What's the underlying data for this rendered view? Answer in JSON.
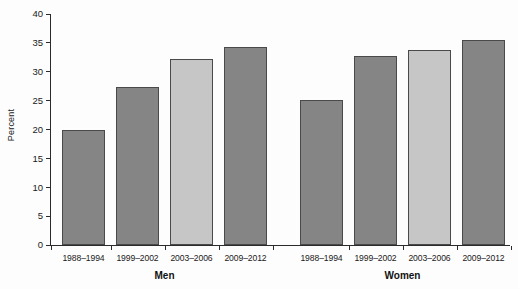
{
  "chart_data": {
    "type": "bar",
    "title": "",
    "xlabel": "",
    "ylabel": "Percent",
    "ylim": [
      0,
      40
    ],
    "yticks": [
      0,
      5,
      10,
      15,
      20,
      25,
      30,
      35,
      40
    ],
    "grid": false,
    "legend": null,
    "categories": [
      "1988–1994",
      "1999–2002",
      "2003–2006",
      "2009–2012"
    ],
    "groups": [
      {
        "name": "Men",
        "bars": [
          {
            "category": "1988–1994",
            "value": 19.9,
            "color": "#858585"
          },
          {
            "category": "1999–2002",
            "value": 27.3,
            "color": "#858585"
          },
          {
            "category": "2003–2006",
            "value": 32.2,
            "color": "#c6c6c6"
          },
          {
            "category": "2009–2012",
            "value": 34.3,
            "color": "#858585"
          }
        ]
      },
      {
        "name": "Women",
        "bars": [
          {
            "category": "1988–1994",
            "value": 25.1,
            "color": "#858585"
          },
          {
            "category": "1999–2002",
            "value": 32.8,
            "color": "#858585"
          },
          {
            "category": "2003–2006",
            "value": 33.8,
            "color": "#c6c6c6"
          },
          {
            "category": "2009–2012",
            "value": 35.5,
            "color": "#858585"
          }
        ]
      }
    ]
  },
  "axis": {
    "ylabel": "Percent",
    "ytick_labels": [
      "0",
      "5",
      "10",
      "15",
      "20",
      "25",
      "30",
      "35",
      "40"
    ]
  },
  "colors": {
    "bar_dark": "#858585",
    "bar_light": "#c6c6c6",
    "bar_edge": "#4a4a4a",
    "axis": "#2b2b2b",
    "text": "#1a1a1a",
    "background": "#fdfdfd"
  }
}
